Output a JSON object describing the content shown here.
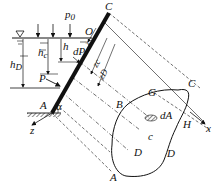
{
  "diagram": {
    "labels": {
      "p0": "p",
      "p0_sub": "0",
      "C_top": "C",
      "O": "O",
      "h": "h",
      "hc": "h",
      "hc_sub": "c",
      "hD": "h",
      "hD_sub": "D",
      "dP": "dP",
      "P": "P",
      "A_left": "A",
      "alpha": "α",
      "z_axis": "z",
      "z": "z",
      "zc": "z",
      "zc_sub": "c",
      "zD": "z",
      "zD_sub": "D",
      "B": "B",
      "G": "G",
      "C_right": "C",
      "x_axis": "x",
      "H": "H",
      "dA": "dA",
      "c": "c",
      "D1": "D",
      "D2": "D",
      "A_bottom": "A"
    },
    "colors": {
      "ink": "#111111",
      "background": "#ffffff"
    }
  }
}
